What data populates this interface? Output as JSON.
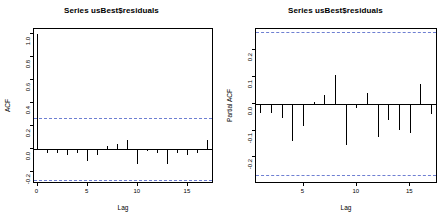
{
  "chart_data": [
    {
      "type": "bar",
      "name": "acf",
      "title": "Series  usBest$residuals",
      "xlabel": "Lag",
      "ylabel": "ACF",
      "xlim": [
        -0.35,
        17.6
      ],
      "ylim": [
        -0.3,
        1.04
      ],
      "xticks": [
        0,
        5,
        10,
        15
      ],
      "yticks": [
        -0.2,
        0.0,
        0.2,
        0.4,
        0.6,
        0.8,
        1.0
      ],
      "ytick_labels": [
        "-0.2",
        "0.0",
        "0.2",
        "0.4",
        "0.6",
        "0.8",
        "1.0"
      ],
      "xtick_labels": [
        "0",
        "5",
        "10",
        "15"
      ],
      "grid": false,
      "legend": "none",
      "conf_level": 0.95,
      "conf_bounds": [
        0.268,
        -0.268
      ],
      "x": [
        0,
        1,
        2,
        3,
        4,
        5,
        6,
        7,
        8,
        9,
        10,
        11,
        12,
        13,
        14,
        15,
        16,
        17
      ],
      "values": [
        1.0,
        -0.034,
        -0.035,
        -0.049,
        -0.029,
        -0.105,
        -0.048,
        0.025,
        0.043,
        0.082,
        -0.125,
        -0.016,
        -0.028,
        -0.127,
        -0.034,
        -0.048,
        -0.036,
        0.078
      ],
      "bar_color": "#000000",
      "conf_color": "#6e7fd2"
    },
    {
      "type": "bar",
      "name": "pacf",
      "title": "Series  usBest$residuals",
      "xlabel": "Lag",
      "ylabel": "Partial ACF",
      "xlim": [
        0.55,
        17.6
      ],
      "ylim": [
        -0.3,
        0.28
      ],
      "xticks": [
        5,
        10,
        15
      ],
      "yticks": [
        -0.2,
        -0.1,
        0.0,
        0.1,
        0.2
      ],
      "ytick_labels": [
        "-0.2",
        "-0.1",
        "0.0",
        "0.1",
        "0.2"
      ],
      "xtick_labels": [
        "5",
        "10",
        "15"
      ],
      "grid": false,
      "legend": "none",
      "conf_level": 0.95,
      "conf_bounds": [
        0.268,
        -0.268
      ],
      "x": [
        1,
        2,
        3,
        4,
        5,
        6,
        7,
        8,
        9,
        10,
        11,
        12,
        13,
        14,
        15,
        16,
        17
      ],
      "values": [
        -0.035,
        -0.036,
        -0.052,
        -0.141,
        -0.082,
        0.007,
        0.034,
        0.108,
        -0.155,
        -0.014,
        0.042,
        -0.123,
        -0.06,
        -0.098,
        -0.108,
        0.074,
        -0.039
      ],
      "bar_color": "#000000",
      "conf_color": "#6e7fd2"
    }
  ],
  "panels": {
    "acf": {
      "title": "Series  usBest$residuals",
      "ylabel": "ACF",
      "xlabel": "Lag"
    },
    "pacf": {
      "title": "Series  usBest$residuals",
      "ylabel": "Partial ACF",
      "xlabel": "Lag"
    }
  }
}
